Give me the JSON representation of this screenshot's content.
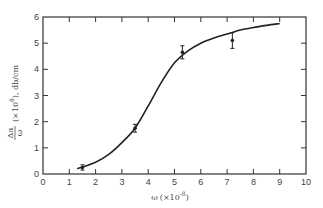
{
  "chart_data": {
    "type": "line",
    "title": "",
    "xlabel": "ω (×10⁻⁸)",
    "xlabel_main": "ω",
    "xlabel_scale": "(×10",
    "xlabel_exp": "-8",
    "xlabel_close": ")",
    "ylabel": "Δα/ω (×10⁸), db/cm",
    "ylabel_num": "Δα",
    "ylabel_den": "ω",
    "ylabel_rest": "(×10",
    "ylabel_exp": "8",
    "ylabel_tail": "), db/cm",
    "xlim": [
      0,
      10
    ],
    "ylim": [
      0,
      6
    ],
    "x_ticks": [
      "0",
      "1",
      "2",
      "3",
      "4",
      "5",
      "6",
      "7",
      "8",
      "9",
      "10"
    ],
    "y_ticks": [
      "0",
      "1",
      "2",
      "3",
      "4",
      "5",
      "6"
    ],
    "grid": false,
    "legend": null,
    "series": [
      {
        "name": "measured",
        "kind": "points-with-error-bars",
        "x": [
          1.5,
          3.5,
          5.3,
          7.2
        ],
        "y": [
          0.25,
          1.75,
          4.65,
          5.1
        ],
        "yerr": [
          0.1,
          0.15,
          0.25,
          0.3
        ]
      },
      {
        "name": "theoretical curve",
        "kind": "smooth-line",
        "x": [
          1.3,
          2.0,
          2.5,
          3.0,
          3.5,
          4.0,
          4.5,
          5.0,
          5.5,
          6.0,
          6.5,
          7.0,
          7.5,
          8.0,
          8.5,
          9.0
        ],
        "y": [
          0.2,
          0.45,
          0.75,
          1.2,
          1.75,
          2.6,
          3.5,
          4.25,
          4.7,
          5.0,
          5.2,
          5.35,
          5.5,
          5.6,
          5.68,
          5.75
        ]
      }
    ]
  }
}
